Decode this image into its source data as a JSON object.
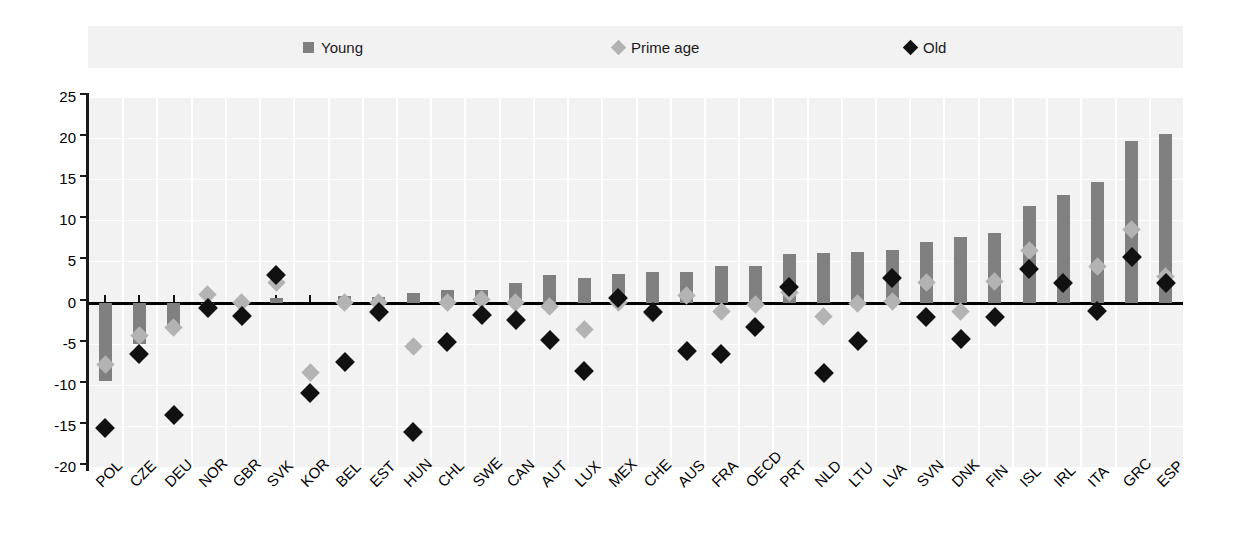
{
  "legend": {
    "items": [
      {
        "label": "Young",
        "marker": "square",
        "color": "#808080",
        "name": "legend-young"
      },
      {
        "label": "Prime age",
        "marker": "diamond",
        "color": "#b3b3b3",
        "name": "legend-prime-age"
      },
      {
        "label": "Old",
        "marker": "diamond",
        "color": "#111111",
        "name": "legend-old"
      }
    ]
  },
  "axis": {
    "y_ticks": [
      "25",
      "20",
      "15",
      "10",
      "5",
      "0",
      "-5",
      "-10",
      "-15",
      "-20"
    ]
  },
  "chart_data": {
    "type": "bar",
    "title": "",
    "subtitle": "",
    "xlabel": "",
    "ylabel": "",
    "ylim": [
      -20,
      25
    ],
    "ytick_step": 5,
    "grid": true,
    "legend_position": "top",
    "categories": [
      "POL",
      "CZE",
      "DEU",
      "NOR",
      "GBR",
      "SVK",
      "KOR",
      "BEL",
      "EST",
      "HUN",
      "CHL",
      "SWE",
      "CAN",
      "AUT",
      "LUX",
      "MEX",
      "CHE",
      "AUS",
      "FRA",
      "OECD",
      "PRT",
      "NLD",
      "LTU",
      "LVA",
      "SVN",
      "DNK",
      "FIN",
      "ISL",
      "IRL",
      "ITA",
      "GRC",
      "ESP"
    ],
    "series": [
      {
        "name": "Young",
        "type": "bar",
        "color": "#808080",
        "values": [
          -9.5,
          -5.0,
          -3.3,
          -0.1,
          -0.2,
          0.6,
          0.0,
          0.8,
          0.7,
          1.2,
          1.5,
          1.5,
          2.4,
          3.3,
          3.0,
          3.5,
          3.7,
          3.7,
          4.4,
          4.4,
          5.9,
          6.0,
          6.1,
          6.4,
          7.4,
          8.0,
          8.5,
          11.8,
          13.1,
          14.7,
          19.6,
          20.5
        ]
      },
      {
        "name": "Prime age",
        "type": "scatter",
        "marker": "diamond",
        "color": "#b3b3b3",
        "values": [
          -7.5,
          -4.0,
          -3.0,
          1.0,
          0.0,
          2.4,
          -8.5,
          0.0,
          0.0,
          -5.3,
          0.0,
          0.4,
          0.0,
          -0.5,
          -3.3,
          0.0,
          -1.3,
          0.9,
          -1.1,
          -0.2,
          1.2,
          -1.7,
          -0.1,
          0.1,
          2.4,
          -1.1,
          2.6,
          6.3,
          2.4,
          4.4,
          8.9,
          3.2
        ]
      },
      {
        "name": "Old",
        "type": "scatter",
        "marker": "diamond",
        "color": "#111111",
        "values": [
          -15.3,
          -6.2,
          -13.7,
          -0.7,
          -1.6,
          3.4,
          -11.0,
          -7.2,
          -1.1,
          -15.7,
          -4.8,
          -1.5,
          -2.1,
          -4.5,
          -8.3,
          0.5,
          -1.2,
          -5.9,
          -6.3,
          -3.0,
          1.9,
          -8.6,
          -4.7,
          3.0,
          -1.8,
          -4.4,
          -1.8,
          4.1,
          2.4,
          -1.0,
          5.6,
          2.4
        ]
      }
    ]
  }
}
